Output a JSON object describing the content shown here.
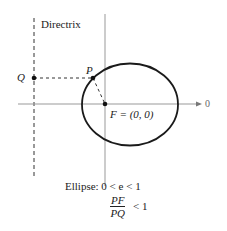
{
  "diagram": {
    "directrix_label": "Directrix",
    "point_q": "Q",
    "point_p": "P",
    "focus_label": "F = (0, 0)",
    "axis_end_label": "0",
    "caption_line1": "Ellipse:  0 < e < 1",
    "fraction_numerator": "PF",
    "fraction_denominator": "PQ",
    "fraction_relation": "< 1",
    "colors": {
      "curve": "#1a1a1a",
      "axis": "#999999",
      "dashed": "#333333"
    }
  }
}
